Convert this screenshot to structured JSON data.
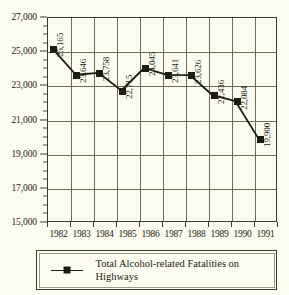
{
  "chart_data": {
    "type": "line",
    "title": "",
    "xlabel": "",
    "ylabel": "",
    "categories": [
      "1982",
      "1983",
      "1984",
      "1985",
      "1986",
      "1987",
      "1988",
      "1989",
      "1990",
      "1991"
    ],
    "values": [
      25165,
      23646,
      23758,
      22715,
      24045,
      23641,
      23626,
      22436,
      22084,
      19900
    ],
    "point_labels": [
      "25,165",
      "23,646",
      "23,758",
      "22,715",
      "24,045",
      "23,641",
      "23,626",
      "22,436",
      "22,084",
      "19,900"
    ],
    "ylim": [
      15000,
      27000
    ],
    "y_ticks": [
      15000,
      17000,
      19000,
      21000,
      23000,
      25000,
      27000
    ],
    "y_tick_labels": [
      "15,000",
      "17,000",
      "19,000",
      "21,000",
      "23,000",
      "25,000",
      "27,000"
    ],
    "y_minor_step": 500,
    "grid": true,
    "legend_position": "below",
    "series": [
      {
        "name": "Total Alcohol-related Fatalities on Highways",
        "values": [
          25165,
          23646,
          23758,
          22715,
          24045,
          23641,
          23626,
          22436,
          22084,
          19900
        ],
        "marker": "square",
        "color": "#1c1c14"
      }
    ]
  },
  "legend": {
    "entry_label": "Total Alcohol-related Fatalities on Highways",
    "marker_icon": "line-square-marker-icon"
  },
  "colors": {
    "background": "#fbfbef",
    "frame": "#3b3b2c",
    "gridline": "#6d6d55",
    "series": "#1c1c14"
  }
}
